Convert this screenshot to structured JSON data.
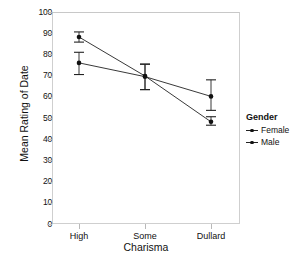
{
  "chart_data": {
    "type": "line",
    "title": "",
    "xlabel": "Charisma",
    "ylabel": "Mean Rating of Date",
    "categories": [
      "High",
      "Some",
      "Dullard"
    ],
    "ylim": [
      0,
      100
    ],
    "yticks": [
      0,
      10,
      20,
      30,
      40,
      50,
      60,
      70,
      80,
      90,
      100
    ],
    "grid": false,
    "legend": {
      "title": "Gender",
      "position": "right",
      "entries": [
        "Female",
        "Male"
      ]
    },
    "error_bars": "95% confidence interval",
    "series": [
      {
        "name": "Female",
        "values": [
          76.0,
          69.5,
          60.2
        ],
        "err_low": [
          70.5,
          63.4,
          53.6
        ],
        "err_high": [
          81.0,
          75.4,
          68.0
        ],
        "color": "#222222",
        "marker": "circle"
      },
      {
        "name": "Male",
        "values": [
          88.2,
          69.8,
          48.2
        ],
        "err_low": [
          85.8,
          63.4,
          46.6
        ],
        "err_high": [
          90.6,
          75.4,
          50.6
        ],
        "color": "#222222",
        "marker": "circle"
      }
    ]
  },
  "axis": {
    "y_tick_labels": [
      "100",
      "90",
      "80",
      "70",
      "60",
      "50",
      "40",
      "30",
      "20",
      "10",
      "0"
    ],
    "x_tick_labels": [
      "High",
      "Some",
      "Dullard"
    ],
    "x_title": "Charisma",
    "y_title": "Mean Rating of Date"
  },
  "legend": {
    "title": "Gender",
    "items": [
      {
        "label": "Female"
      },
      {
        "label": "Male"
      }
    ]
  },
  "colors": {
    "line": "#222222",
    "marker": "#111111",
    "frame": "#cfcfcf",
    "tick": "#b9b9b9",
    "background": "#ffffff"
  }
}
